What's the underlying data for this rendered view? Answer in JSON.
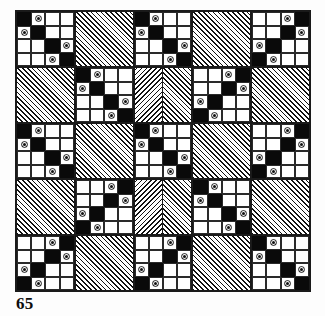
{
  "figure": {
    "caption": "65",
    "colors": {
      "ink": "#0a0a0a",
      "fabric_light": "#ffffff",
      "fabric_hatch": "#111111",
      "page": "#fdfdfd"
    }
  },
  "quilt": {
    "grid_rows": 5,
    "grid_cols": 5,
    "block_types": {
      "A": "chain-nine-patch",
      "B": "hatched-plain",
      "C": "hatched-split-mirrored"
    },
    "layout": [
      [
        "A",
        "B",
        "A",
        "B",
        "A"
      ],
      [
        "B",
        "A",
        "C",
        "A",
        "B"
      ],
      [
        "A",
        "B",
        "A",
        "B",
        "A"
      ],
      [
        "B",
        "A",
        "C",
        "A",
        "B"
      ],
      [
        "A",
        "B",
        "A",
        "B",
        "A"
      ]
    ],
    "chain_cells": [
      [
        "k",
        "d",
        "w",
        "w"
      ],
      [
        "d",
        "k",
        "w",
        "w"
      ],
      [
        "w",
        "w",
        "k",
        "d"
      ],
      [
        "w",
        "w",
        "d",
        "k"
      ]
    ],
    "chain_cells_mirror_x": [
      [
        "w",
        "w",
        "d",
        "k"
      ],
      [
        "w",
        "w",
        "k",
        "d"
      ],
      [
        "d",
        "k",
        "w",
        "w"
      ],
      [
        "k",
        "d",
        "w",
        "w"
      ]
    ],
    "hatch_direction_default": "right",
    "hatch_direction_split": [
      "left",
      "right"
    ]
  }
}
